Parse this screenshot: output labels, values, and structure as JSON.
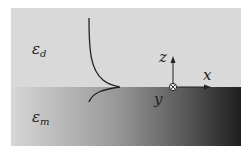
{
  "labels": {
    "dielectric": {
      "symbol": "ε",
      "subscript": "d"
    },
    "metal": {
      "symbol": "ε",
      "subscript": "m"
    },
    "axis_z": "z",
    "axis_x": "x",
    "axis_y": "y"
  },
  "colors": {
    "dielectric_bg": "#d9d9d9",
    "metal_gradient_start": "#d6d6d6",
    "metal_gradient_end": "#1e1e1e",
    "line": "#222222"
  }
}
